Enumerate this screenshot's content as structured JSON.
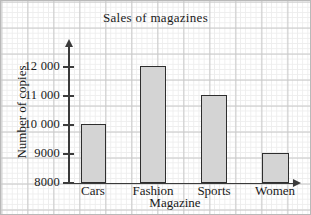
{
  "chart_data": {
    "type": "bar",
    "title": "Sales of magazines",
    "xlabel": "Magazine",
    "ylabel": "Number of copies",
    "categories": [
      "Cars",
      "Fashion",
      "Sports",
      "Women"
    ],
    "values": [
      10000,
      12000,
      11000,
      9000
    ],
    "ytick_labels": [
      "12 000",
      "11 000",
      "10 000",
      "9000",
      "8000"
    ],
    "ytick_values": [
      12000,
      11000,
      10000,
      9000,
      8000
    ],
    "ylim": [
      8000,
      12500
    ],
    "grid": true,
    "legend": "none",
    "bar_fill": "#d4d4d4",
    "bar_outline": "#2e2e2e",
    "axis_color": "#3b3b3b",
    "grid_minor_color": "#ededed",
    "grid_major_color": "#c8c8c8",
    "background": "#ffffff"
  },
  "ticks": [
    {
      "label": "12 000",
      "y": 67
    },
    {
      "label": "11 000",
      "y": 96
    },
    {
      "label": "10 000",
      "y": 125
    },
    {
      "label": "9000",
      "y": 154
    },
    {
      "label": "8000",
      "y": 183
    }
  ],
  "bars": [
    {
      "label": "Cars",
      "value": 10000,
      "left": 81,
      "width": 25,
      "top": 124,
      "height": 59,
      "label_left": 62,
      "label_width": 62
    },
    {
      "label": "Fashion",
      "value": 12000,
      "left": 140,
      "width": 26,
      "top": 66,
      "height": 117,
      "label_left": 122,
      "label_width": 62
    },
    {
      "label": "Sports",
      "value": 11000,
      "left": 201,
      "width": 26,
      "top": 95,
      "height": 88,
      "label_left": 183,
      "label_width": 62
    },
    {
      "label": "Women",
      "value": 9000,
      "left": 262,
      "width": 27,
      "top": 153,
      "height": 30,
      "label_left": 244,
      "label_width": 62
    }
  ]
}
